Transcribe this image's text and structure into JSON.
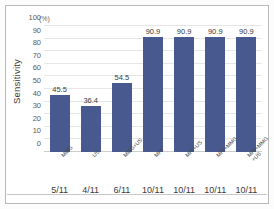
{
  "chart_data": {
    "type": "bar",
    "title": "",
    "xlabel": "",
    "ylabel": "Sensitivity",
    "unit_label": "(%)",
    "ylim": [
      0,
      100
    ],
    "yticks": [
      100,
      90,
      80,
      70,
      60,
      50,
      40,
      30,
      20,
      10,
      0
    ],
    "grid": true,
    "legend": "none",
    "bar_color": "#47598e",
    "categories": [
      "MMG",
      "US",
      "MMG+US",
      "MRI",
      "MRI+US",
      "MRI+MMG",
      "MRI+MMG+US"
    ],
    "category_labels": [
      "MMG",
      "US",
      "MMG+US",
      "MRI",
      "MRI+US",
      "MRI+MMG",
      "MRI+MMG\n+US"
    ],
    "values": [
      45.5,
      36.4,
      54.5,
      90.9,
      90.9,
      90.9,
      90.9
    ],
    "value_labels": [
      "45.5",
      "36.4",
      "54.5",
      "90.9",
      "90.9",
      "90.9",
      "90.9"
    ],
    "fractions": [
      "5/11",
      "4/11",
      "6/11",
      "10/11",
      "10/11",
      "10/11",
      "10/11"
    ]
  }
}
